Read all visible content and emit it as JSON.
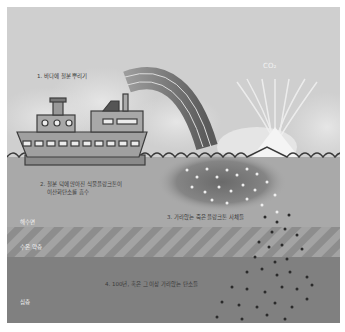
{
  "diagram": {
    "steps": [
      {
        "number": "1",
        "label": "1. 바다에 철분 뿌리기"
      },
      {
        "number": "2",
        "label_line1": "2. 철분 덕에 많아진 식물플랑크톤이",
        "label_line2": "이산화탄소를 흡수"
      },
      {
        "number": "3",
        "label": "3. 가라앉는 죽은 플랑크톤 사체들"
      },
      {
        "number": "4",
        "label": "4. 100년, 혹은 그 이상 가라앉는 탄소들"
      }
    ],
    "gas_label": "CO₂",
    "layers": [
      {
        "name": "surface",
        "label": "해수면"
      },
      {
        "name": "thermocline",
        "label": "수온 약층"
      },
      {
        "name": "deep",
        "label": "심층"
      }
    ],
    "colors": {
      "sky": "#cfcfcf",
      "surface_water": "#a9a9a9",
      "thermocline": "#8f8f8f",
      "deep": "#808080",
      "ship": "#9a9a9a",
      "ship_outline": "#3c3c3c",
      "particles_light": "#efefef",
      "particles_dark": "#2a2a2a"
    }
  }
}
